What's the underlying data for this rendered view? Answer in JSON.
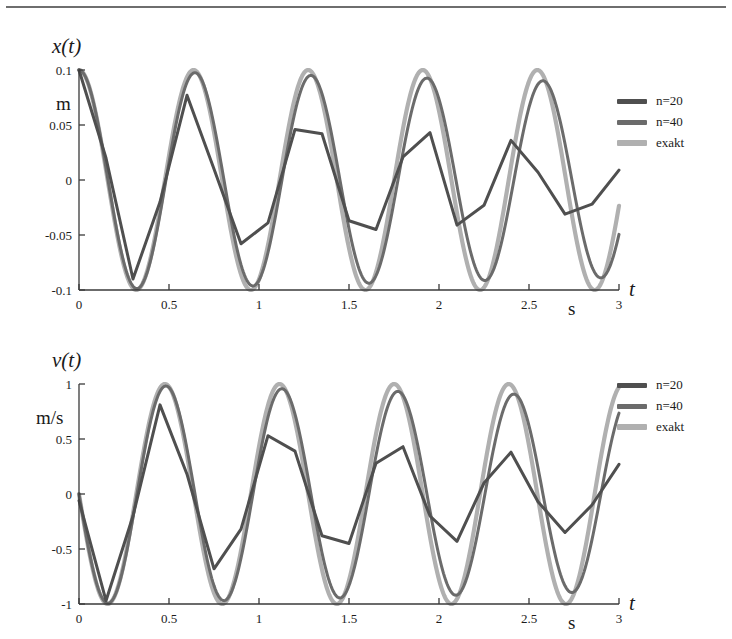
{
  "figure": {
    "background": "#ffffff",
    "rule_color": "#6e6e6e"
  },
  "series_colors": {
    "n20": "#4f4f4f",
    "n40": "#6b6b6b",
    "exakt": "#b0b0b0"
  },
  "legend": {
    "items": [
      {
        "label": "n=20",
        "color": "#4f4f4f"
      },
      {
        "label": "n=40",
        "color": "#6b6b6b"
      },
      {
        "label": "exakt",
        "color": "#b0b0b0"
      }
    ]
  },
  "panels": [
    {
      "id": "position",
      "y_name": "x(t)",
      "y_unit": "m",
      "x_name": "t",
      "x_unit": "s",
      "y_ticks": [
        "0.1",
        "0.05",
        "0",
        "-0.05",
        "-0.1"
      ],
      "x_ticks": [
        "0",
        "0.5",
        "1",
        "1.5",
        "2",
        "2.5",
        "3"
      ]
    },
    {
      "id": "velocity",
      "y_name": "v(t)",
      "y_unit": "m/s",
      "x_name": "t",
      "x_unit": "s",
      "y_ticks": [
        "1",
        "0.5",
        "0",
        "-0.5",
        "-1"
      ],
      "x_ticks": [
        "0",
        "0.5",
        "1",
        "1.5",
        "2",
        "2.5",
        "3"
      ]
    }
  ],
  "chart_data": [
    {
      "type": "line",
      "id": "position-chart",
      "title": "x(t)",
      "xlabel": "t",
      "xunit": "s",
      "ylabel": "x(t)",
      "yunit": "m",
      "xlim": [
        0,
        3
      ],
      "ylim": [
        -0.1,
        0.1
      ],
      "xticks": [
        0,
        0.5,
        1,
        1.5,
        2,
        2.5,
        3
      ],
      "yticks": [
        -0.1,
        -0.05,
        0,
        0.05,
        0.1
      ],
      "grid": false,
      "legend_position": "right",
      "series": [
        {
          "name": "exakt",
          "color": "#b0b0b0",
          "width": 4.0,
          "model": "cosine",
          "amplitude": 0.1,
          "frequency_hz": 1.5708,
          "phase_deg": 0,
          "x": [
            0,
            0.159,
            0.318,
            0.477,
            0.637,
            0.796,
            0.955,
            1.114,
            1.273,
            1.432,
            1.591,
            1.751,
            1.91,
            2.069,
            2.228,
            2.387,
            2.546,
            2.706,
            2.865,
            3.0
          ],
          "y": [
            0.1,
            0.0,
            -0.1,
            0.0,
            0.1,
            0.0,
            -0.1,
            0.0,
            0.1,
            0.0,
            -0.1,
            0.0,
            0.1,
            0.0,
            -0.1,
            0.0,
            0.1,
            0.0,
            -0.1,
            0.0159
          ]
        },
        {
          "name": "n=40",
          "color": "#6b6b6b",
          "width": 3.0,
          "steps": 40,
          "comment": "tracks exact closely, slight amplitude loss and phase lag",
          "peaks_y": [
            0.1,
            0.097,
            0.093,
            0.089
          ],
          "troughs_y": [
            -0.098,
            -0.095,
            -0.092,
            -0.09
          ]
        },
        {
          "name": "n=20",
          "color": "#4f4f4f",
          "width": 3.0,
          "steps": 20,
          "comment": "piecewise-linear, strong amplitude decay and phase lag",
          "x": [
            0.0,
            0.15,
            0.3,
            0.45,
            0.6,
            0.75,
            0.9,
            1.05,
            1.2,
            1.35,
            1.5,
            1.65,
            1.8,
            1.95,
            2.1,
            2.25,
            2.4,
            2.55,
            2.7,
            2.85,
            3.0
          ],
          "y": [
            0.1,
            0.02,
            -0.09,
            -0.02,
            0.077,
            0.01,
            -0.058,
            -0.039,
            0.046,
            0.042,
            -0.037,
            -0.045,
            0.021,
            0.043,
            -0.041,
            -0.023,
            0.036,
            0.007,
            -0.031,
            -0.022,
            0.009
          ],
          "peaks_y": [
            0.077,
            0.046,
            0.043,
            0.036
          ],
          "troughs_y": [
            -0.09,
            -0.058,
            -0.045,
            -0.041
          ]
        }
      ]
    },
    {
      "type": "line",
      "id": "velocity-chart",
      "title": "v(t)",
      "xlabel": "t",
      "xunit": "s",
      "ylabel": "v(t)",
      "yunit": "m/s",
      "xlim": [
        0,
        3
      ],
      "ylim": [
        -1,
        1
      ],
      "xticks": [
        0,
        0.5,
        1,
        1.5,
        2,
        2.5,
        3
      ],
      "yticks": [
        -1,
        -0.5,
        0,
        0.5,
        1
      ],
      "grid": false,
      "legend_position": "right",
      "series": [
        {
          "name": "exakt",
          "color": "#b0b0b0",
          "width": 4.0,
          "model": "negative-sine",
          "amplitude": 1.0,
          "frequency_hz": 1.5708,
          "phase_deg": 0,
          "x": [
            0,
            0.159,
            0.318,
            0.477,
            0.637,
            0.796,
            0.955,
            1.114,
            1.273,
            1.432,
            1.591,
            1.751,
            1.91,
            2.069,
            2.228,
            2.387,
            2.546,
            2.706,
            2.865,
            3.0
          ],
          "y": [
            0.0,
            -1.0,
            0.0,
            1.0,
            0.0,
            -1.0,
            0.0,
            1.0,
            0.0,
            -1.0,
            0.0,
            1.0,
            0.0,
            -1.0,
            0.0,
            1.0,
            0.0,
            -1.0,
            0.0,
            0.95
          ]
        },
        {
          "name": "n=40",
          "color": "#6b6b6b",
          "width": 3.0,
          "steps": 40,
          "comment": "tracks exact closely, slight amplitude loss",
          "peaks_y": [
            0.97,
            0.96,
            0.97,
            0.9
          ],
          "troughs_y": [
            -0.99,
            -0.95,
            -0.99,
            -0.92
          ]
        },
        {
          "name": "n=20",
          "color": "#4f4f4f",
          "width": 3.0,
          "steps": 20,
          "comment": "piecewise-linear, strong amplitude decay and phase lag",
          "x": [
            0.0,
            0.15,
            0.3,
            0.45,
            0.6,
            0.75,
            0.9,
            1.05,
            1.2,
            1.35,
            1.5,
            1.65,
            1.8,
            1.95,
            2.1,
            2.25,
            2.4,
            2.55,
            2.7,
            2.85,
            3.0
          ],
          "y": [
            -0.06,
            -0.97,
            -0.2,
            0.81,
            0.18,
            -0.68,
            -0.32,
            0.53,
            0.39,
            -0.38,
            -0.45,
            0.28,
            0.43,
            -0.2,
            -0.43,
            0.1,
            0.38,
            -0.07,
            -0.35,
            -0.1,
            0.27
          ],
          "peaks_y": [
            0.81,
            0.53,
            0.43,
            0.38
          ],
          "troughs_y": [
            -0.97,
            -0.68,
            -0.45,
            -0.43
          ]
        }
      ]
    }
  ]
}
